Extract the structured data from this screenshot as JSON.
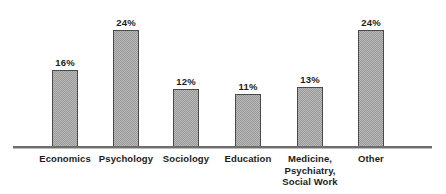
{
  "chart_data": {
    "type": "bar",
    "title": "",
    "subtitle": "",
    "xlabel": "",
    "ylabel": "",
    "categories": [
      "Economics",
      "Psychology",
      "Sociology",
      "Education",
      "Medicine,\nPsychiatry,\nSocial Work",
      "Other"
    ],
    "values": [
      16,
      24,
      12,
      11,
      13,
      24
    ],
    "value_labels": [
      "16%",
      "24%",
      "12%",
      "11%",
      "13%",
      "24%"
    ],
    "unit": "%",
    "ylim": [
      0,
      24
    ],
    "grid": false,
    "legend": false,
    "axis": {
      "show_y_axis": false,
      "show_x_axis": true,
      "x_axis_color": "#6e6e6e"
    },
    "style": {
      "bar_fill": "#b9b9b9",
      "bar_pattern": "checkerboard-dither",
      "bar_pattern_color": "#9a9a9a",
      "bar_border": "#4a4a4a",
      "text_color": "#1c1c1c",
      "background": "#ffffff"
    },
    "bars": [
      {
        "category": "Economics",
        "value": 16,
        "value_label": "16%",
        "label_lines": [
          "Economics"
        ],
        "x": 52,
        "width": 26,
        "top": 70
      },
      {
        "category": "Psychology",
        "value": 24,
        "value_label": "24%",
        "label_lines": [
          "Psychology"
        ],
        "x": 113,
        "width": 26,
        "top": 30
      },
      {
        "category": "Sociology",
        "value": 12,
        "value_label": "12%",
        "label_lines": [
          "Sociology"
        ],
        "x": 173,
        "width": 26,
        "top": 89
      },
      {
        "category": "Education",
        "value": 11,
        "value_label": "11%",
        "label_lines": [
          "Education"
        ],
        "x": 235,
        "width": 26,
        "top": 94
      },
      {
        "category": "Medicine, Psychiatry, Social Work",
        "value": 13,
        "value_label": "13%",
        "label_lines": [
          "Medicine,",
          "Psychiatry,",
          "Social Work"
        ],
        "x": 297,
        "width": 26,
        "top": 87
      },
      {
        "category": "Other",
        "value": 24,
        "value_label": "24%",
        "label_lines": [
          "Other"
        ],
        "x": 358,
        "width": 26,
        "top": 30
      }
    ]
  }
}
